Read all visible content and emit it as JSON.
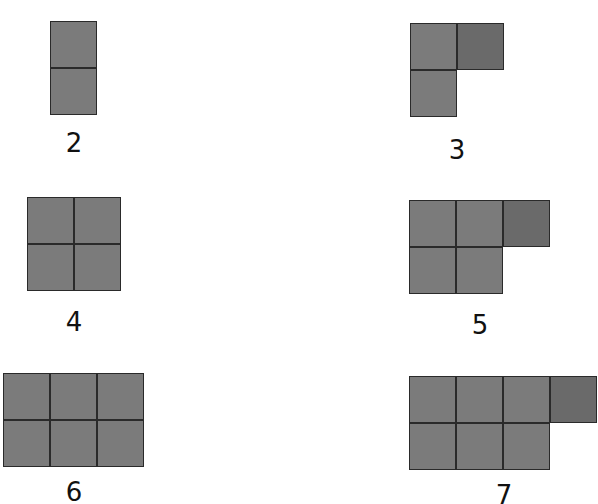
{
  "colors": {
    "cell_fill": "#7b7b7b",
    "extra_cell_fill": "#6a6a6a",
    "border": "#2a2a2a",
    "background": "#ffffff"
  },
  "figures": [
    {
      "label": "2",
      "cols": 1,
      "rows": 2,
      "extra": false,
      "x": 50,
      "y": 21,
      "label_x": 54,
      "label_y": 130
    },
    {
      "label": "3",
      "cols": 1,
      "rows": 2,
      "extra": true,
      "x": 410,
      "y": 23,
      "label_x": 437,
      "label_y": 137
    },
    {
      "label": "4",
      "cols": 2,
      "rows": 2,
      "extra": false,
      "x": 27,
      "y": 197,
      "label_x": 54,
      "label_y": 309
    },
    {
      "label": "5",
      "cols": 2,
      "rows": 2,
      "extra": true,
      "x": 409,
      "y": 200,
      "label_x": 460,
      "label_y": 312
    },
    {
      "label": "6",
      "cols": 3,
      "rows": 2,
      "extra": false,
      "x": 3,
      "y": 373,
      "label_x": 54,
      "label_y": 479
    },
    {
      "label": "7",
      "cols": 3,
      "rows": 2,
      "extra": true,
      "x": 409,
      "y": 376,
      "label_x": 484,
      "label_y": 482
    }
  ]
}
